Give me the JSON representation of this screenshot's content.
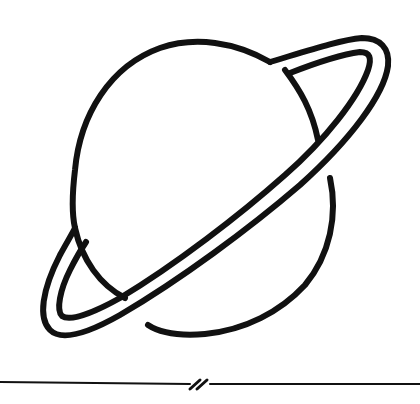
{
  "image": {
    "subject": "ringed-planet-line-drawing",
    "stroke_color": "#111111",
    "background_color": "#ffffff"
  }
}
